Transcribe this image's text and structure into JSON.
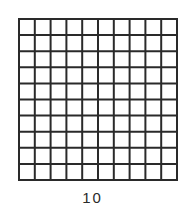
{
  "diagram": {
    "type": "grid",
    "rows": 10,
    "columns": 10,
    "line_color": "#2a2a2a",
    "fill_color": "#ffffff",
    "label": "10"
  }
}
